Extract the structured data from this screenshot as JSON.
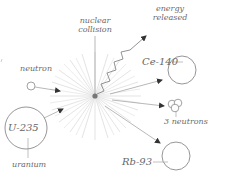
{
  "diagram": {
    "type": "nuclear-fission-illustration",
    "labels": {
      "collision_line1": "nuclear",
      "collision_line2": "collision",
      "energy_line1": "energy",
      "energy_line2": "released",
      "neutron": "neutron",
      "uranium_symbol": "U-235",
      "uranium_name": "uranium",
      "cerium_symbol": "Ce-140",
      "neutrons_out": "3 neutrons",
      "rubidium_symbol": "Rb-93"
    },
    "colors": {
      "stroke": "#8a8a8a",
      "burst": "#d8d8d8",
      "center": "#777777",
      "arrow": "#333333",
      "text": "#6a6a6a"
    }
  }
}
